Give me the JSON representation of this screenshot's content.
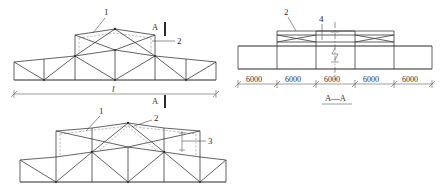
{
  "drawing": {
    "title_section": "A—A",
    "views": {
      "top_elevation": {
        "name": "top-truss-elevation",
        "span_label": "l",
        "callouts": [
          {
            "id": "1",
            "text": "1"
          },
          {
            "id": "2",
            "text": "2"
          }
        ],
        "section_markers": [
          {
            "text": "A",
            "position": "upper"
          },
          {
            "text": "A",
            "position": "lower"
          }
        ]
      },
      "bottom_elevation": {
        "name": "bottom-truss-elevation",
        "callouts": [
          {
            "id": "1",
            "text": "1"
          },
          {
            "id": "2",
            "text": "2"
          },
          {
            "id": "3",
            "text": "3"
          }
        ]
      },
      "section_aa": {
        "name": "section-a-a",
        "caption": "A—A",
        "callouts": [
          {
            "id": "2",
            "text": "2"
          },
          {
            "id": "4",
            "text": "4"
          }
        ],
        "dimensions": [
          "6000",
          "6000",
          "6000",
          "6000",
          "6000"
        ]
      }
    },
    "colors": {
      "line": "#3b3b3b",
      "line_heavy": "#2b2b2b",
      "dashed": "#8d8d8d",
      "dimension": "#5c5c5c",
      "background": "#ffffff"
    }
  }
}
